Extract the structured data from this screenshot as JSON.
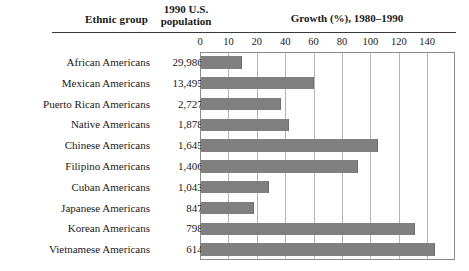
{
  "header": {
    "col_ethnic": "Ethnic group",
    "col_population_line1": "1990 U.S.",
    "col_population_line2": "population",
    "col_growth": "Growth (%), 1980–1990"
  },
  "colors": {
    "bar": "#808080",
    "gridline": "#b4b4b4",
    "frame": "#8a8a8a",
    "text": "#1a1a1a",
    "rule": "#3a3a3a"
  },
  "chart_data": {
    "type": "bar",
    "orientation": "horizontal",
    "title": "Growth (%), 1980–1990",
    "xlabel": "",
    "ylabel": "Ethnic group",
    "grid": true,
    "legend": false,
    "xticks": [
      0,
      10,
      20,
      40,
      60,
      80,
      100,
      120,
      140
    ],
    "xtick_labels": [
      "0",
      "10",
      "20",
      "40",
      "60",
      "80",
      "100",
      "120",
      "140"
    ],
    "xaxis_note": "tick marks are evenly spaced although the 0-10-20 interval differs from the 20-40-60 interval",
    "categories": [
      "African Americans",
      "Mexican Americans",
      "Puerto Rican Americans",
      "Native Americans",
      "Chinese Americans",
      "Filipino Americans",
      "Cuban Americans",
      "Japanese Americans",
      "Korean Americans",
      "Vietnamese Americans"
    ],
    "populations": [
      "29,986,060",
      "13,495,938",
      "2,727,754",
      "1,878,285",
      "1,645,472",
      "1,406,770",
      "1,043,932",
      "847,562",
      "798,849",
      "614,547"
    ],
    "values": [
      13,
      54,
      35,
      38,
      100,
      82,
      30,
      21,
      125,
      134
    ],
    "bar_pixel_widths": [
      41,
      113,
      80,
      88,
      177,
      157,
      68,
      53,
      214,
      234
    ]
  }
}
